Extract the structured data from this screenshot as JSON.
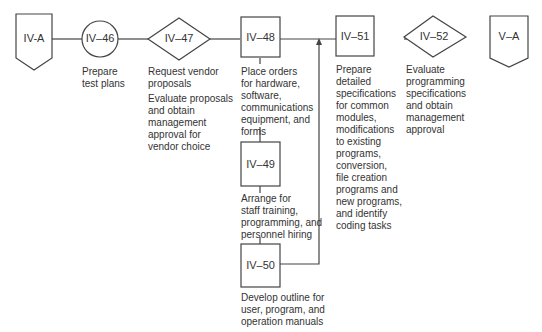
{
  "nodes": [
    {
      "id": "IV-A",
      "shape": "offpage-connector",
      "label": "IV-A"
    },
    {
      "id": "IV-46",
      "shape": "circle",
      "label": "IV–46",
      "description": "Prepare\ntest plans"
    },
    {
      "id": "IV-47",
      "shape": "diamond",
      "label": "IV–47",
      "description": "Request vendor\nproposals",
      "description2": "Evaluate proposals\nand obtain\nmanagement\napproval for\nvendor choice"
    },
    {
      "id": "IV-48",
      "shape": "box",
      "label": "IV–48",
      "description": "Place orders\nfor hardware,\nsoftware,\ncommunications\nequipment, and\nforms"
    },
    {
      "id": "IV-49",
      "shape": "box",
      "label": "IV–49",
      "description": "Arrange for\nstaff training,\nprogramming, and\npersonnel hiring"
    },
    {
      "id": "IV-50",
      "shape": "box",
      "label": "IV–50",
      "description": "Develop outline for\nuser, program, and\noperation manuals"
    },
    {
      "id": "IV-51",
      "shape": "box",
      "label": "IV–51",
      "description": "Prepare\ndetailed\nspecifications\nfor common\nmodules,\nmodifications\nto existing\nprograms,\nconversion,\nfile creation\nprograms and\nnew programs,\nand identify\ncoding tasks"
    },
    {
      "id": "IV-52",
      "shape": "diamond",
      "label": "IV–52",
      "description": "Evaluate\nprogramming\nspecifications\nand obtain\nmanagement\napproval"
    },
    {
      "id": "V-A",
      "shape": "offpage-connector",
      "label": "V–A"
    }
  ],
  "colors": {
    "stroke": "#444444",
    "text": "#333333"
  }
}
